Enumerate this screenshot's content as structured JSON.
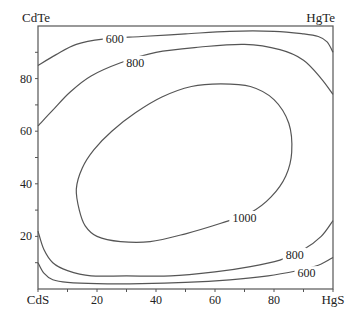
{
  "chart_data": {
    "type": "contour",
    "title": "",
    "corner_labels": {
      "bottom_left": "CdS",
      "bottom_right": "HgS",
      "top_left": "CdTe",
      "top_right": "HgTe"
    },
    "x_ticks": [
      {
        "value": 20,
        "label": "20"
      },
      {
        "value": 40,
        "label": "40"
      },
      {
        "value": 60,
        "label": "60"
      },
      {
        "value": 80,
        "label": "80"
      }
    ],
    "y_ticks": [
      {
        "value": 20,
        "label": "20"
      },
      {
        "value": 40,
        "label": "40"
      },
      {
        "value": 60,
        "label": "60"
      },
      {
        "value": 80,
        "label": "80"
      }
    ],
    "minor_tick_step": 10,
    "xlim": [
      0,
      100
    ],
    "ylim": [
      0,
      100
    ],
    "grid": false,
    "contours": [
      {
        "level": 1000,
        "label": "1000",
        "closed": true,
        "label_pos": [
          70,
          27
        ],
        "points": [
          [
            14,
            30
          ],
          [
            13,
            38
          ],
          [
            15,
            46
          ],
          [
            19,
            53
          ],
          [
            25,
            60
          ],
          [
            33,
            67
          ],
          [
            42,
            73
          ],
          [
            52,
            77
          ],
          [
            62,
            78
          ],
          [
            72,
            77
          ],
          [
            80,
            72
          ],
          [
            85,
            63
          ],
          [
            86,
            52
          ],
          [
            84,
            43
          ],
          [
            79,
            35
          ],
          [
            72,
            29
          ],
          [
            62,
            25
          ],
          [
            50,
            21
          ],
          [
            38,
            18
          ],
          [
            28,
            18
          ],
          [
            20,
            20
          ],
          [
            16,
            24
          ],
          [
            14,
            30
          ]
        ]
      },
      {
        "level": 800,
        "label": "800",
        "side": "upper",
        "label_pos": [
          33,
          86
        ],
        "points": [
          [
            0,
            62
          ],
          [
            5,
            68
          ],
          [
            11,
            75
          ],
          [
            18,
            81
          ],
          [
            28,
            86
          ],
          [
            40,
            90
          ],
          [
            55,
            92
          ],
          [
            70,
            93
          ],
          [
            82,
            91
          ],
          [
            90,
            87
          ],
          [
            96,
            80
          ],
          [
            100,
            74
          ]
        ]
      },
      {
        "level": 600,
        "label": "600",
        "side": "upper",
        "label_pos": [
          26,
          95
        ],
        "points": [
          [
            0,
            85
          ],
          [
            6,
            89
          ],
          [
            13,
            93
          ],
          [
            22,
            95
          ],
          [
            35,
            96
          ],
          [
            50,
            97
          ],
          [
            65,
            98
          ],
          [
            80,
            98
          ],
          [
            90,
            97
          ],
          [
            95,
            96
          ],
          [
            98,
            94
          ],
          [
            100,
            90
          ]
        ]
      },
      {
        "level": 800,
        "label": "800",
        "side": "lower",
        "label_pos": [
          87,
          13
        ],
        "points": [
          [
            0,
            22
          ],
          [
            2,
            15
          ],
          [
            5,
            10
          ],
          [
            10,
            7
          ],
          [
            18,
            5
          ],
          [
            30,
            5
          ],
          [
            45,
            5
          ],
          [
            60,
            6.5
          ],
          [
            72,
            8.5
          ],
          [
            82,
            11
          ],
          [
            90,
            15
          ],
          [
            96,
            20
          ],
          [
            100,
            26
          ]
        ]
      },
      {
        "level": 600,
        "label": "600",
        "side": "lower",
        "label_pos": [
          91,
          6
        ],
        "points": [
          [
            0,
            10
          ],
          [
            2,
            6
          ],
          [
            5,
            3.5
          ],
          [
            10,
            2.5
          ],
          [
            20,
            2
          ],
          [
            35,
            2
          ],
          [
            50,
            2.5
          ],
          [
            65,
            3.5
          ],
          [
            78,
            5
          ],
          [
            88,
            7
          ],
          [
            95,
            9
          ],
          [
            100,
            12
          ]
        ]
      }
    ]
  }
}
